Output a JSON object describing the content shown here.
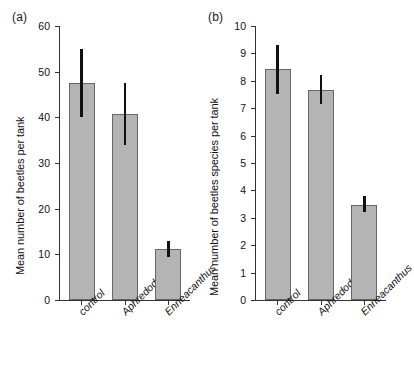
{
  "figure": {
    "panels": [
      {
        "label": "(a)",
        "ylabel": "Mean number of beetles per tank"
      },
      {
        "label": "(b)",
        "ylabel": "Mean number of beetles species per tank"
      }
    ]
  },
  "chart_data": [
    {
      "type": "bar",
      "panel": "(a)",
      "title": "",
      "xlabel": "",
      "ylabel": "Mean number of beetles per tank",
      "categories": [
        "control",
        "Aphredoderus",
        "Enneacanthus"
      ],
      "values": [
        47.5,
        40.7,
        11.2
      ],
      "errors_low": [
        40.0,
        34.0,
        9.4
      ],
      "errors_high": [
        55.0,
        47.5,
        13.0
      ],
      "ylim": [
        0,
        60
      ],
      "yticks": [
        0,
        10,
        20,
        30,
        40,
        50,
        60
      ],
      "ytick_labels": [
        "0",
        "10",
        "20",
        "30",
        "40",
        "50",
        "60"
      ],
      "grid": false,
      "legend": "none",
      "bar_color": "#b4b4b4",
      "bar_edge_color": "#666666",
      "error_color": "#111111"
    },
    {
      "type": "bar",
      "panel": "(b)",
      "title": "",
      "xlabel": "",
      "ylabel": "Mean number of beetles species per tank",
      "categories": [
        "control",
        "Aphredoderus",
        "Enneacanthus"
      ],
      "values": [
        8.42,
        7.68,
        3.46
      ],
      "errors_low": [
        7.52,
        7.15,
        3.2
      ],
      "errors_high": [
        9.3,
        8.2,
        3.8
      ],
      "ylim": [
        0,
        10
      ],
      "yticks": [
        0,
        1,
        2,
        3,
        4,
        5,
        6,
        7,
        8,
        9,
        10
      ],
      "ytick_labels": [
        "0",
        "1",
        "2",
        "3",
        "4",
        "5",
        "6",
        "7",
        "8",
        "9",
        "10"
      ],
      "grid": false,
      "legend": "none",
      "bar_color": "#b4b4b4",
      "bar_edge_color": "#666666",
      "error_color": "#111111"
    }
  ]
}
